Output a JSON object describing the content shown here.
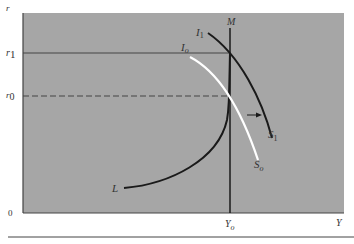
{
  "diagram": {
    "type": "IS-LM economics diagram",
    "axes": {
      "y_label": "r",
      "x_label": "Y",
      "origin_label": "0"
    },
    "y_ticks": [
      {
        "label": "r",
        "sub": "1",
        "name": "r1"
      },
      {
        "label": "r",
        "sub": "0",
        "name": "r0"
      }
    ],
    "x_ticks": [
      {
        "label": "Y",
        "sub": "o",
        "name": "Yo"
      }
    ],
    "curves": {
      "M": {
        "label": "M"
      },
      "I1": {
        "label": "I",
        "sub": "1"
      },
      "Io": {
        "label": "I",
        "sub": "o"
      },
      "S1": {
        "label": "S",
        "sub": "1"
      },
      "So": {
        "label": "S",
        "sub": "o"
      },
      "L": {
        "label": "L"
      }
    },
    "colors": {
      "panel": "#a6a6a6",
      "curve_dark": "#1a1a1a",
      "curve_white": "#ffffff",
      "rule": "#444444"
    }
  }
}
